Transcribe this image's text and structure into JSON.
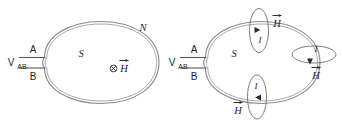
{
  "figure": {
    "background_color": "#ffffff",
    "stroke_color": "#8c8c8c",
    "text_color": "#1f1f1f",
    "accent_color": "#2b2b2b"
  },
  "panels": [
    {
      "id": "left-panel",
      "name": "coil-field-into-page",
      "source_label": "V",
      "source_subscript": "AB",
      "terminal_top_label": "A",
      "terminal_bottom_label": "B",
      "inside_label": "S",
      "outside_label": "N",
      "field_symbol": "⊗",
      "field_label": "H",
      "field_vector_label": "H⃗",
      "field_direction": "into-page"
    },
    {
      "id": "right-panel",
      "name": "coil-field-loops",
      "source_label": "V",
      "source_subscript": "AB",
      "terminal_top_label": "A",
      "terminal_bottom_label": "B",
      "inside_label": "S",
      "current_label": "I",
      "field_label": "H",
      "field_vector_label": "H⃗",
      "loops": [
        {
          "name": "field-loop-top",
          "orientation": "vertical",
          "current_label": "I",
          "field_label": "H",
          "arrow_direction": "right"
        },
        {
          "name": "field-loop-right",
          "orientation": "horizontal",
          "current_label": "I",
          "field_label": "H",
          "arrow_direction": "down"
        },
        {
          "name": "field-loop-bottom",
          "orientation": "vertical",
          "current_label": "I",
          "field_label": "H",
          "arrow_direction": "left"
        }
      ]
    }
  ]
}
